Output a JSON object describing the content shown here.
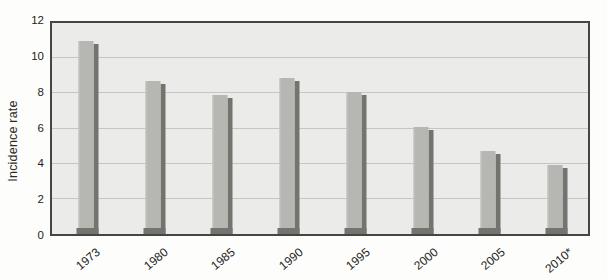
{
  "chart_data": {
    "type": "bar",
    "title": "",
    "categories": [
      "1973",
      "1980",
      "1985",
      "1990",
      "1995",
      "2000",
      "2005",
      "2010*"
    ],
    "values": [
      11.0,
      8.7,
      7.9,
      8.9,
      8.1,
      6.1,
      4.7,
      3.9
    ],
    "xlabel": "",
    "ylabel": "Incidence rate",
    "ylim": [
      0,
      12
    ],
    "yticks": [
      0,
      2,
      4,
      6,
      8,
      10,
      12
    ],
    "ytick_step": 2,
    "grid": true,
    "legend": "none",
    "bar_style": "flat gray with dark drop shadow (right and base)"
  },
  "colors": {
    "page_bg": "#fdfdfc",
    "plot_bg": "#ebebe9",
    "gridline": "#c5c5c2",
    "frame": "#454543",
    "bar_fill": "#b6b7b3",
    "bar_shadow": "#73746e",
    "text": "#242422"
  }
}
